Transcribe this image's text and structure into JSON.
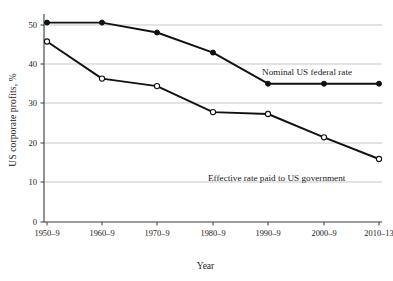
{
  "chart_data": {
    "type": "line",
    "title": "",
    "xlabel": "Year",
    "ylabel": "US corporate profits, %",
    "categories": [
      "1950–9",
      "1960–9",
      "1970–9",
      "1980–9",
      "1990–9",
      "2000–9",
      "2010–13"
    ],
    "ylim": [
      0,
      52
    ],
    "yticks": [
      0,
      10,
      20,
      30,
      40,
      50
    ],
    "ytick_labels": [
      "0",
      "10",
      "20",
      "30",
      "40",
      "50"
    ],
    "grid": "horizontal",
    "legend_position": "inline-annotations",
    "series": [
      {
        "name": "Nominal US federal rate",
        "marker": "filled-circle",
        "color": "#111111",
        "values": [
          50.6,
          50.6,
          48.1,
          43.0,
          35.1,
          35.1,
          35.1
        ]
      },
      {
        "name": "Effective rate paid to US government",
        "marker": "open-circle",
        "color": "#111111",
        "values": [
          45.8,
          36.4,
          34.5,
          27.9,
          27.4,
          21.5,
          16.0
        ]
      }
    ],
    "annotations": [
      {
        "text": "Nominal US federal rate",
        "x_category": "1990–9",
        "y_value": 37.5
      },
      {
        "text": "Effective rate paid to US government",
        "x_category": "1990–9",
        "y_value": 18.5
      }
    ]
  },
  "axis": {
    "y_label": "US corporate profits, %",
    "x_label": "Year",
    "y_ticks": [
      "50",
      "40",
      "30",
      "20",
      "10",
      "0"
    ],
    "x_ticks": [
      "1950–9",
      "1960–9",
      "1970–9",
      "1980–9",
      "1990–9",
      "2000–9",
      "2010–13"
    ]
  },
  "annotations": {
    "nominal": "Nominal US federal rate",
    "effective": "Effective rate paid to US government"
  },
  "colors": {
    "line": "#111111",
    "grid": "#b9b9b9",
    "axis": "#3a3a3a",
    "text": "#1a1a1a",
    "background": "#ffffff"
  }
}
